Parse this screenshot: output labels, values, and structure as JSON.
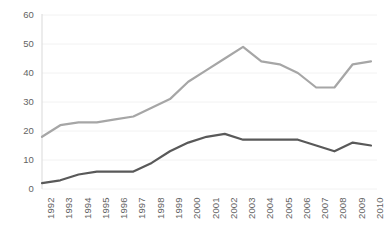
{
  "chart_data": {
    "type": "line",
    "title": "",
    "subtitle": "",
    "xlabel": "",
    "ylabel": "",
    "grid": true,
    "grid_axis": "y",
    "legend": "none",
    "ylim": [
      0,
      60
    ],
    "yticks": [
      0,
      10,
      20,
      30,
      40,
      50,
      60
    ],
    "ytick_labels": [
      "0",
      "10",
      "20",
      "30",
      "40",
      "50",
      "60"
    ],
    "categories": [
      "1992",
      "1993",
      "1994",
      "1995",
      "1996",
      "1997",
      "1998",
      "1999",
      "2000",
      "2001",
      "2002",
      "2003",
      "2004",
      "2005",
      "2006",
      "2007",
      "2008",
      "2009",
      "2010"
    ],
    "x": [
      1992,
      1993,
      1994,
      1995,
      1996,
      1997,
      1998,
      1999,
      2000,
      2001,
      2002,
      2003,
      2004,
      2005,
      2006,
      2007,
      2008,
      2009,
      2010
    ],
    "series": [
      {
        "name": "upper-series",
        "color": "#a6a6a6",
        "line_width": 2.2,
        "values": [
          18,
          22,
          23,
          23,
          24,
          25,
          28,
          31,
          37,
          41,
          45,
          49,
          44,
          43,
          40,
          35,
          35,
          43,
          44
        ]
      },
      {
        "name": "lower-series",
        "color": "#595959",
        "line_width": 2.2,
        "values": [
          2,
          3,
          5,
          6,
          6,
          6,
          9,
          13,
          16,
          18,
          19,
          17,
          17,
          17,
          17,
          15,
          13,
          16,
          15
        ]
      }
    ]
  },
  "axes": {
    "y_axis_line_color": "#d9d9d9",
    "grid_color": "#f2f2f2",
    "tick_label_color": "#636363"
  }
}
